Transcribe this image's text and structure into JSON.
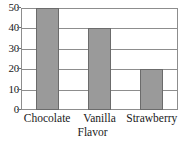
{
  "chart_data": {
    "type": "bar",
    "title": "",
    "title_clipped": true,
    "subtitle": "",
    "categories": [
      "Chocolate",
      "Vanilla",
      "Strawberry"
    ],
    "values": [
      50,
      40,
      20
    ],
    "series": [
      {
        "name": "Votes",
        "values": [
          50,
          40,
          20
        ]
      }
    ],
    "xlabel": "Flavor",
    "ylabel": "",
    "ylim": [
      0,
      50
    ],
    "yticks": [
      0,
      10,
      20,
      30,
      40,
      50
    ],
    "ytick_labels": [
      "0",
      "10",
      "20",
      "30",
      "40",
      "50"
    ],
    "grid": true,
    "grid_axis": "y",
    "legend": false,
    "legend_position": "none",
    "bar_color": "#9a9a9a",
    "bar_edge_color": "#6b6b6b",
    "frame_color": "#8d8d8d",
    "background": "#ffffff"
  },
  "axis": {
    "x_title": "Flavor"
  }
}
